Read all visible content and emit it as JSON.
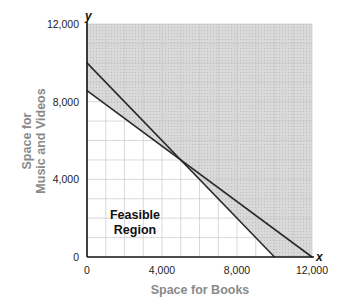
{
  "chart_data": {
    "type": "line",
    "title": "",
    "xlabel": "Space for Books",
    "ylabel_lines": [
      "Space for",
      "Music and Videos"
    ],
    "ylabel": "Space for Music and Videos",
    "x_var": "x",
    "y_var": "y",
    "xlim": [
      0,
      12000
    ],
    "ylim": [
      0,
      12000
    ],
    "x_ticks": [
      0,
      4000,
      8000,
      12000
    ],
    "x_tick_labels": [
      "0",
      "4,000",
      "8,000",
      "12,000"
    ],
    "y_ticks": [
      0,
      4000,
      8000,
      12000
    ],
    "y_tick_labels": [
      "0",
      "4,000",
      "8,000",
      "12,000"
    ],
    "grid": true,
    "grid_step": 1000,
    "series": [
      {
        "name": "constraint-1",
        "x": [
          0,
          10000
        ],
        "y": [
          10000,
          0
        ]
      },
      {
        "name": "constraint-2",
        "x": [
          0,
          12000
        ],
        "y": [
          8571,
          0
        ]
      }
    ],
    "intersection": {
      "x": 5000,
      "y": 5000
    },
    "feasible_region": {
      "label_lines": [
        "Feasible",
        "Region"
      ],
      "polygon": [
        [
          0,
          0
        ],
        [
          0,
          8571
        ],
        [
          5000,
          5000
        ],
        [
          10000,
          0
        ]
      ]
    },
    "annotations": [
      "Feasible Region"
    ],
    "colors": {
      "shade": "#d6d6d6",
      "grid": "#c8c8c8",
      "line": "#2a2a2a",
      "axis_title": "#8a8a8a"
    }
  }
}
